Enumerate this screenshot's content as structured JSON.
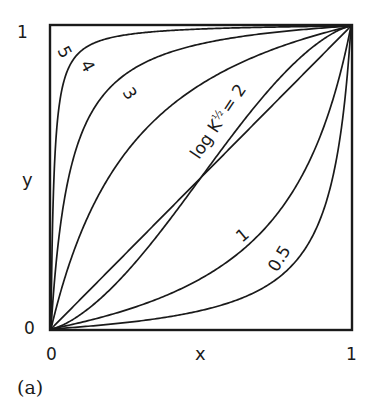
{
  "chart_data": {
    "type": "line",
    "title": "",
    "panel_label": "(a)",
    "xlabel": "x",
    "ylabel": "y",
    "xlim": [
      0,
      1
    ],
    "ylim": [
      0,
      1
    ],
    "grid": false,
    "legend": "none (curves labeled inline)",
    "x_ticks": [
      "0",
      "1"
    ],
    "y_ticks": [
      "0",
      "1"
    ],
    "series": [
      {
        "name": "5",
        "label": "5",
        "kind": "langmuir",
        "K": 100
      },
      {
        "name": "4",
        "label": "4",
        "kind": "langmuir",
        "K": 16
      },
      {
        "name": "3",
        "label": "3",
        "kind": "langmuir",
        "K": 4.2
      },
      {
        "name": "log K1/2 = 2",
        "label": "log K½ = 2",
        "kind": "sigmoid",
        "n": 1.35
      },
      {
        "name": "diagonal",
        "label": "",
        "kind": "langmuir",
        "K": 1
      },
      {
        "name": "1",
        "label": "1",
        "kind": "langmuir",
        "K": 0.2
      },
      {
        "name": "0.5",
        "label": "0.5",
        "kind": "langmuir",
        "K": 0.065
      }
    ],
    "sample_points": {
      "x_at_y_0.5": {
        "5": 0.01,
        "4": 0.06,
        "3": 0.2,
        "2": 0.5,
        "diagonal": 0.5,
        "1": 0.84,
        "0.5": 0.94
      }
    }
  },
  "labels": {
    "y_top": "1",
    "y_bottom": "0",
    "x_left": "0",
    "x_right": "1",
    "x_axis": "x",
    "y_axis": "y",
    "panel": "(a)",
    "curve_5": "5",
    "curve_4": "4",
    "curve_3": "3",
    "curve_2": "log K",
    "curve_2_sub": "½",
    "curve_2_eq": "= 2",
    "curve_1": "1",
    "curve_05": "0.5"
  }
}
